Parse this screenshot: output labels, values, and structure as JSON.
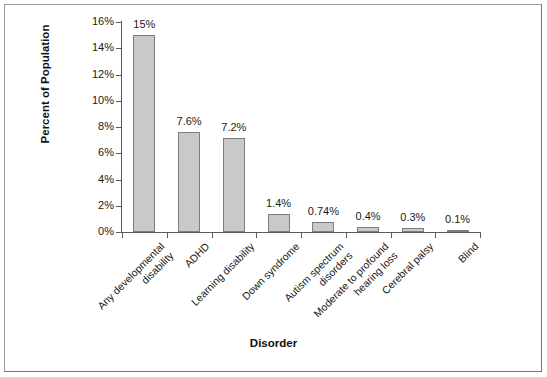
{
  "chart_data": {
    "type": "bar",
    "title": "",
    "subtitle": "",
    "xlabel": "Disorder",
    "ylabel": "Percent of Population",
    "ylim": [
      0,
      16
    ],
    "yticks": [
      0,
      2,
      4,
      6,
      8,
      10,
      12,
      14,
      16
    ],
    "ytick_labels": [
      "0%",
      "2%",
      "4%",
      "6%",
      "8%",
      "10%",
      "12%",
      "14%",
      "16%"
    ],
    "grid": false,
    "legend": false,
    "legend_position": "none",
    "categories": [
      "Any developmental\ndisability",
      "ADHD",
      "Learning disability",
      "Down syndrome",
      "Autism spectrum\ndisorders",
      "Moderate to profound\nhearing loss",
      "Cerebral palsy",
      "Blind"
    ],
    "category_lines": [
      [
        "Any developmental",
        "disability"
      ],
      [
        "ADHD"
      ],
      [
        "Learning disability"
      ],
      [
        "Down syndrome"
      ],
      [
        "Autism spectrum",
        "disorders"
      ],
      [
        "Moderate to profound",
        "hearing loss"
      ],
      [
        "Cerebral palsy"
      ],
      [
        "Blind"
      ]
    ],
    "values": [
      15,
      7.6,
      7.2,
      1.4,
      0.74,
      0.4,
      0.3,
      0.1
    ],
    "data_labels": [
      "15%",
      "7.6%",
      "7.2%",
      "1.4%",
      "0.74%",
      "0.4%",
      "0.3%",
      "0.1%"
    ],
    "bar_color": "#c9c9c9",
    "bar_border_color": "#7d7d7d",
    "axis_color": "#5a5a5a",
    "text_color": "#1a1a1a",
    "background": "#ffffff",
    "frame_border_color": "#a8a8a8"
  }
}
